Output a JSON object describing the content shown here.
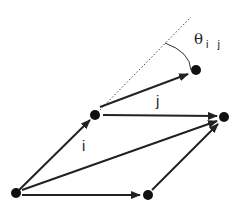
{
  "diagram": {
    "labels": {
      "i": "i",
      "j": "j",
      "theta": "θ",
      "theta_sub": "i j"
    },
    "nodes": [
      {
        "id": "origin",
        "x": 16,
        "y": 193
      },
      {
        "id": "i_end",
        "x": 95,
        "y": 115
      },
      {
        "id": "target",
        "x": 196,
        "y": 70
      },
      {
        "id": "sum",
        "x": 224,
        "y": 117
      },
      {
        "id": "j_end",
        "x": 148,
        "y": 195
      }
    ],
    "colors": {
      "stroke": "#222222",
      "dotted": "#444444",
      "background": "#ffffff"
    }
  }
}
